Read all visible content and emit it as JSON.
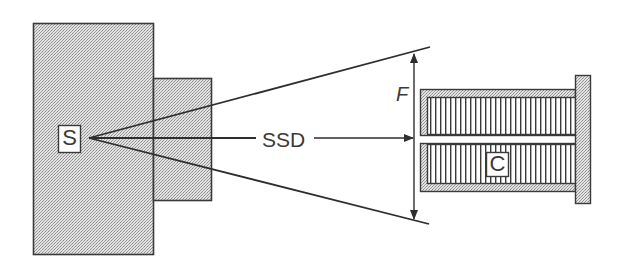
{
  "diagram": {
    "labels": {
      "source": "S",
      "collimator": "C",
      "distance": "SSD",
      "field": "F"
    },
    "colors": {
      "stroke": "#3a3a3a",
      "fill_stipple": "#d4d4d4",
      "background": "#ffffff"
    },
    "components": [
      {
        "id": "source-housing",
        "label": "S"
      },
      {
        "id": "housing-nozzle"
      },
      {
        "id": "beam-rays",
        "count": 3
      },
      {
        "id": "field-size-arrow",
        "label": "F"
      },
      {
        "id": "ssd-arrow",
        "label": "SSD"
      },
      {
        "id": "collimator-assembly",
        "label": "C"
      }
    ]
  }
}
